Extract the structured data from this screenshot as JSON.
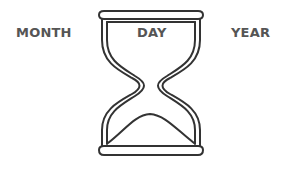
{
  "labels": {
    "month": "MONTH",
    "day": "DAY",
    "year": "YEAR"
  },
  "icon": "hourglass-icon",
  "colors": {
    "stroke": "#333333",
    "text": "#555555",
    "background": "#ffffff"
  }
}
